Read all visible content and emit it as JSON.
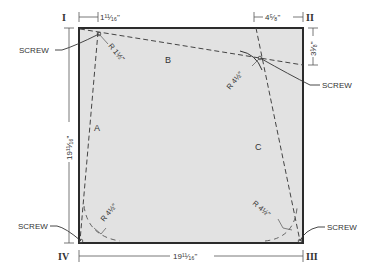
{
  "diagram": {
    "type": "cutting-template",
    "colors": {
      "panel_fill": "#e2e2e2",
      "panel_border": "#2b2b2b",
      "cut_line": "#444444",
      "dimension_line": "#555555",
      "text": "#333333",
      "background": "#ffffff"
    },
    "corners": [
      {
        "id": "I",
        "label": "I"
      },
      {
        "id": "II",
        "label": "II"
      },
      {
        "id": "III",
        "label": "III"
      },
      {
        "id": "IV",
        "label": "IV"
      }
    ],
    "regions": [
      {
        "id": "A",
        "label": "A"
      },
      {
        "id": "B",
        "label": "B"
      },
      {
        "id": "C",
        "label": "C"
      }
    ],
    "dimensions": {
      "top_left_offset": "1¹¹⁄₁₆\"",
      "top_right_offset": "4⁵⁄₈\"",
      "right_top_offset": "3¹⁄₈\"",
      "left_height": "19¹¹⁄₁₆\"",
      "bottom_width": "19¹¹⁄₁₆\""
    },
    "radii": {
      "top_left": "R 1½\"",
      "top_right": "R 4½\"",
      "bottom_left": "R 4½\"",
      "bottom_right": "R 4½\""
    },
    "callouts": {
      "screw_top_left": "SCREW",
      "screw_top_right": "SCREW",
      "screw_bottom_left": "SCREW",
      "screw_bottom_right": "SCREW"
    }
  }
}
